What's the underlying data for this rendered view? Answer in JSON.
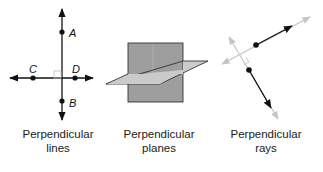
{
  "figures": [
    {
      "id": "perpendicular-lines",
      "caption_line1": "Perpendicular",
      "caption_line2": "lines",
      "points": [
        {
          "label": "A"
        },
        {
          "label": "B"
        },
        {
          "label": "C"
        },
        {
          "label": "D"
        }
      ]
    },
    {
      "id": "perpendicular-planes",
      "caption_line1": "Perpendicular",
      "caption_line2": "planes"
    },
    {
      "id": "perpendicular-rays",
      "caption_line1": "Perpendicular",
      "caption_line2": "rays"
    }
  ],
  "colors": {
    "line": "#111111",
    "plane_vertical": "#9c9c9c",
    "plane_horizontal": "#c8c8c8",
    "extension_gray": "#c4c4c4"
  }
}
